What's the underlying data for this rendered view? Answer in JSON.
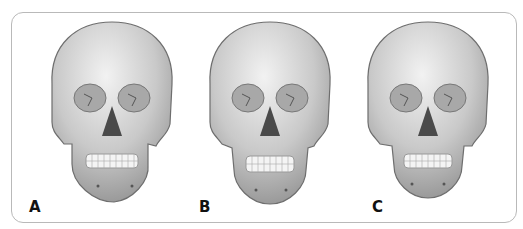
{
  "figure": {
    "panels": [
      {
        "id": "A",
        "label": "A",
        "subject": "skull-frontal-view",
        "variant": "wide-mandible"
      },
      {
        "id": "B",
        "label": "B",
        "subject": "skull-frontal-view",
        "variant": "long-narrow-mandible"
      },
      {
        "id": "C",
        "label": "C",
        "subject": "skull-frontal-view",
        "variant": "symmetric-mandible"
      }
    ],
    "colors": {
      "bone": "#d4d4d4",
      "shadow": "#8c8c8c",
      "outline": "#6e6e6e",
      "frame": "#b9b9b9"
    }
  }
}
